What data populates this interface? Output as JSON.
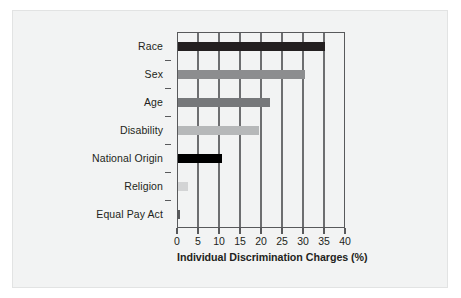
{
  "chart_data": {
    "type": "bar",
    "orientation": "horizontal",
    "title": "",
    "xlabel": "Individual Discrimination Charges (%)",
    "ylabel": "",
    "categories": [
      "Race",
      "Sex",
      "Age",
      "Disability",
      "National Origin",
      "Religion",
      "Equal Pay Act"
    ],
    "values": [
      35.3,
      30.4,
      22.2,
      19.6,
      10.6,
      2.7,
      0.7
    ],
    "bar_colors": [
      "#231f20",
      "#8c8d8f",
      "#76787a",
      "#b6b8b9",
      "#000000",
      "#d3d4d5",
      "#58595b"
    ],
    "xlim": [
      0,
      40
    ],
    "xticks": [
      0,
      5,
      10,
      15,
      20,
      25,
      30,
      35,
      40
    ],
    "xtick_labels": [
      "0",
      "5",
      "10",
      "15",
      "20",
      "25",
      "30",
      "35",
      "40"
    ],
    "grid": true,
    "grid_axis": "x",
    "legend": false,
    "legend_position": "none",
    "annotations": []
  },
  "figure": {
    "background_color": "#f2f3f3",
    "axis_color": "#58595b",
    "text_color": "#231f20"
  }
}
